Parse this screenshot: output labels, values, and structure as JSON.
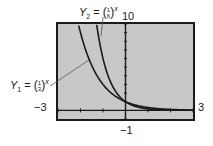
{
  "chart_data": {
    "type": "line",
    "title": "",
    "window": {
      "xmin": -3,
      "xmax": 3,
      "ymin": -1,
      "ymax": 10
    },
    "xlabel": "",
    "ylabel": "",
    "tick_labels": {
      "xmin": "-3",
      "xmax": "3",
      "ymin": "-1",
      "ymax": "10"
    },
    "x_ticks": [
      -3,
      -2,
      -1,
      0,
      1,
      2,
      3
    ],
    "y_ticks": [
      -1,
      0,
      1,
      2,
      3,
      4,
      5,
      6,
      7,
      8,
      9,
      10
    ],
    "grid": false,
    "series": [
      {
        "name": "Y1",
        "expression": "(1/3)^x",
        "base_num": 1,
        "base_den": 3,
        "x": [
          -2.096,
          -2,
          -1.5,
          -1,
          -0.5,
          0,
          0.5,
          1,
          1.5,
          2,
          2.5,
          3
        ],
        "y": [
          10,
          9,
          5.196,
          3,
          1.732,
          1,
          0.577,
          0.333,
          0.192,
          0.111,
          0.064,
          0.037
        ]
      },
      {
        "name": "Y2",
        "expression": "(1/6)^x",
        "base_num": 1,
        "base_den": 6,
        "x": [
          -1.285,
          -1,
          -0.5,
          0,
          0.5,
          1,
          1.5,
          2,
          2.5,
          3
        ],
        "y": [
          10,
          6,
          2.449,
          1,
          0.408,
          0.167,
          0.068,
          0.028,
          0.011,
          0.005
        ]
      }
    ],
    "annotations": [
      {
        "text": "Y1 = (1/3)^x",
        "target": "Y1"
      },
      {
        "text": "Y2 = (1/6)^x",
        "target": "Y2"
      }
    ]
  },
  "labels": {
    "y1_name": "Y",
    "y1_sub": "1",
    "y1_num": "1",
    "y1_den": "3",
    "y1_exp": "x",
    "y2_name": "Y",
    "y2_sub": "2",
    "y2_num": "1",
    "y2_den": "6",
    "y2_exp": "x",
    "equals": "=",
    "lparen": "(",
    "rparen": ")",
    "xmin": "−3",
    "xmax": "3",
    "ymin": "−1",
    "ymax": "10"
  },
  "colors": {
    "screen": "#c8c8c8",
    "frame": "#1a1a1a",
    "curve": "#1a1a1a",
    "axis": "#1a1a1a",
    "leader": "#555555"
  }
}
